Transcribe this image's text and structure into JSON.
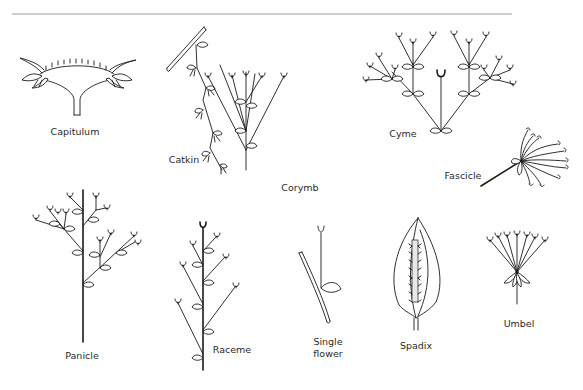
{
  "diagram": {
    "type": "botanical-illustration",
    "rule_color": "#9a9a9a",
    "line_color": "#1a1a1a",
    "background": "#ffffff",
    "figures": [
      {
        "id": "capitulum",
        "label": "Capitulum"
      },
      {
        "id": "catkin",
        "label": "Catkin"
      },
      {
        "id": "corymb",
        "label": "Corymb"
      },
      {
        "id": "cyme",
        "label": "Cyme"
      },
      {
        "id": "fascicle",
        "label": "Fascicle"
      },
      {
        "id": "panicle",
        "label": "Panicle"
      },
      {
        "id": "raceme",
        "label": "Raceme"
      },
      {
        "id": "single-flower",
        "label_line1": "Single",
        "label_line2": "flower"
      },
      {
        "id": "spadix",
        "label": "Spadix"
      },
      {
        "id": "umbel",
        "label": "Umbel"
      }
    ]
  }
}
